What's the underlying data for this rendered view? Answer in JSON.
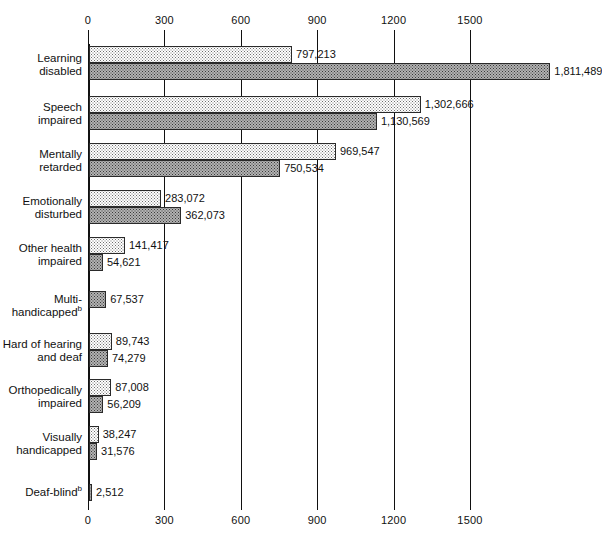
{
  "chart_data": {
    "type": "bar",
    "orientation": "horizontal",
    "title": "",
    "xlabel": "",
    "ylabel": "",
    "xlim": [
      0,
      1560
    ],
    "xticks": [
      0,
      300,
      600,
      900,
      1200,
      1500
    ],
    "xtick_labels": [
      "0",
      "300",
      "600",
      "900",
      "1200",
      "1500"
    ],
    "axis_top": true,
    "axis_bottom": true,
    "grid": true,
    "legend": "none",
    "units": "thousands",
    "categories": [
      "Learning disabled",
      "Speech impaired",
      "Mentally retarded",
      "Emotionally disturbed",
      "Other health impaired",
      "Multi-handicapped",
      "Hard of hearing and deaf",
      "Orthopedically impaired",
      "Visually handicapped",
      "Deaf-blind"
    ],
    "category_footnotes": {
      "Multi-handicapped": "b",
      "Deaf-blind": "b"
    },
    "series": [
      {
        "name": "series-1",
        "style": "light-stipple",
        "values": [
          797213,
          1302666,
          969547,
          283072,
          141417,
          null,
          89743,
          87008,
          38247,
          null
        ],
        "labels": [
          "797,213",
          "1,302,666",
          "969,547",
          "283,072",
          "141,417",
          "",
          "89,743",
          "87,008",
          "38,247",
          ""
        ]
      },
      {
        "name": "series-2",
        "style": "dark-hatch",
        "values": [
          1811489,
          1130569,
          750534,
          362073,
          54621,
          67537,
          74279,
          56209,
          31576,
          2512
        ],
        "labels": [
          "1,811,489",
          "1,130,569",
          "750,534",
          "362,073",
          "54,621",
          "67,537",
          "74,279",
          "56,209",
          "31,576",
          "2,512"
        ]
      }
    ]
  },
  "layout": {
    "x_origin_px": 88,
    "px_per_unit": 0.0002547,
    "group_tops_px": [
      46,
      96,
      143,
      190,
      237,
      291,
      333,
      379,
      426,
      484
    ],
    "label_tops_px": [
      52,
      101,
      148,
      195,
      242,
      293,
      338,
      384,
      431,
      486
    ],
    "bar_height_px": 17
  },
  "colors": {
    "axis": "#111111",
    "bar_border": "#2a2a2a",
    "series1_fill": "#ffffff",
    "series1_dot": "#6e6e6e",
    "series2_fill": "#b2b2b2",
    "series2_dot": "#3a3a3a",
    "text": "#111111",
    "background": "#ffffff"
  }
}
